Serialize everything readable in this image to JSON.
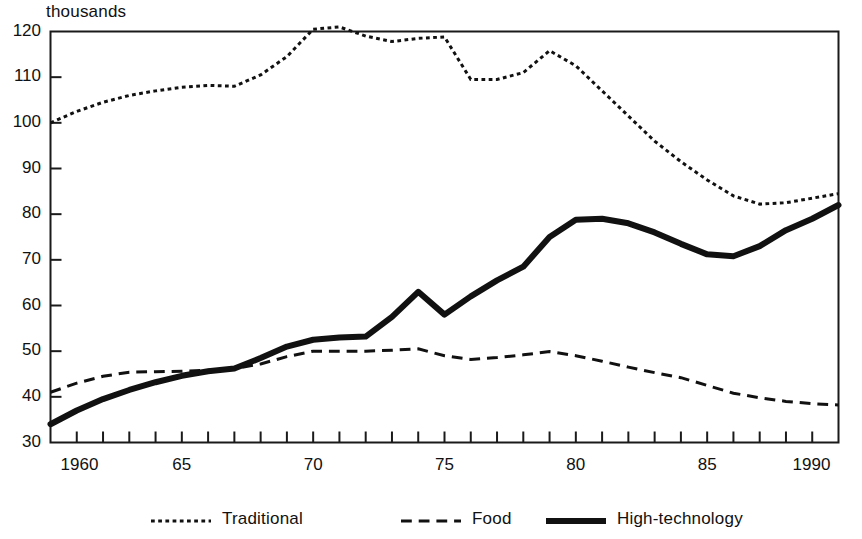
{
  "chart_data": {
    "type": "line",
    "title": "",
    "subtitle": "",
    "unit_label": "thousands",
    "xlabel": "",
    "ylabel": "",
    "xlim": [
      1960,
      1990
    ],
    "ylim": [
      30,
      120
    ],
    "grid": false,
    "legend_position": "bottom",
    "y_ticks": [
      30,
      40,
      50,
      60,
      70,
      80,
      90,
      100,
      110,
      120
    ],
    "y_tick_labels": [
      "30",
      "40",
      "50",
      "60",
      "70",
      "80",
      "90",
      "100",
      "110",
      "120"
    ],
    "x_ticks": [
      1960,
      1961,
      1962,
      1963,
      1964,
      1965,
      1966,
      1967,
      1968,
      1969,
      1970,
      1971,
      1972,
      1973,
      1974,
      1975,
      1976,
      1977,
      1978,
      1979,
      1980,
      1981,
      1982,
      1983,
      1984,
      1985,
      1986,
      1987,
      1988,
      1989,
      1990
    ],
    "x_labeled_ticks": [
      1960,
      1965,
      1970,
      1975,
      1980,
      1985,
      1990
    ],
    "x_tick_labels": [
      "1960",
      "65",
      "70",
      "75",
      "80",
      "85",
      "1990"
    ],
    "x": [
      1960,
      1961,
      1962,
      1963,
      1964,
      1965,
      1966,
      1967,
      1968,
      1969,
      1970,
      1971,
      1972,
      1973,
      1974,
      1975,
      1976,
      1977,
      1978,
      1979,
      1980,
      1981,
      1982,
      1983,
      1984,
      1985,
      1986,
      1987,
      1988,
      1989,
      1990
    ],
    "series": [
      {
        "name": "Traditional",
        "style": "dotted",
        "color": "#111111",
        "width": 3,
        "values": [
          100.0,
          102.5,
          104.5,
          106.0,
          107.0,
          107.8,
          108.2,
          108.0,
          110.5,
          114.5,
          120.5,
          121.0,
          119.0,
          117.8,
          118.5,
          118.8,
          109.5,
          109.5,
          111.0,
          115.8,
          112.5,
          107.0,
          101.5,
          96.0,
          91.5,
          87.5,
          84.0,
          82.2,
          82.5,
          83.5,
          84.5
        ]
      },
      {
        "name": "Food",
        "style": "dashed",
        "color": "#111111",
        "width": 3,
        "values": [
          41.0,
          43.0,
          44.5,
          45.4,
          45.5,
          45.6,
          45.8,
          46.2,
          47.2,
          48.8,
          50.0,
          50.0,
          50.0,
          50.2,
          50.5,
          49.0,
          48.2,
          48.6,
          49.2,
          49.9,
          49.0,
          47.8,
          46.5,
          45.3,
          44.2,
          42.5,
          40.8,
          39.8,
          39.0,
          38.5,
          38.2
        ]
      },
      {
        "name": "High-technology",
        "style": "solid",
        "color": "#111111",
        "width": 6,
        "values": [
          34.0,
          37.0,
          39.5,
          41.5,
          43.2,
          44.6,
          45.6,
          46.2,
          48.5,
          51.0,
          52.5,
          53.0,
          53.2,
          57.5,
          63.0,
          58.0,
          62.0,
          65.5,
          68.5,
          75.0,
          78.8,
          79.0,
          78.0,
          76.0,
          73.5,
          71.2,
          70.8,
          73.0,
          76.5,
          79.0,
          82.0
        ]
      }
    ],
    "legend": [
      {
        "label": "Traditional",
        "style": "dotted"
      },
      {
        "label": "Food",
        "style": "dashed"
      },
      {
        "label": "High-technology",
        "style": "solid"
      }
    ]
  }
}
